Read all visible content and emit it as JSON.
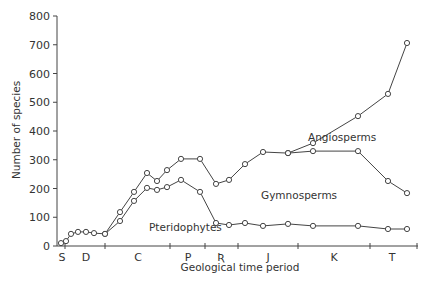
{
  "chart_data": {
    "type": "line",
    "title": "",
    "xlabel": "Geological time period",
    "ylabel": "Number of species",
    "ylim": [
      0,
      800
    ],
    "yticks": [
      0,
      100,
      200,
      300,
      400,
      500,
      600,
      700,
      800
    ],
    "grid": false,
    "legend": "inline labels",
    "period_labels": [
      "S",
      "D",
      "C",
      "P",
      "Tr",
      "J",
      "K",
      "T"
    ],
    "x_positions": [
      61,
      66,
      71,
      78,
      86,
      94,
      105,
      120,
      134,
      147,
      157,
      167,
      181,
      200,
      216,
      229,
      245,
      263,
      288,
      313,
      358,
      388,
      407
    ],
    "series": [
      {
        "name": "Pteridophytes",
        "x": [
          61,
          66,
          71,
          78,
          86,
          94,
          105,
          120,
          134,
          147,
          157,
          167,
          181,
          200,
          216,
          229,
          245,
          263,
          288,
          313,
          358,
          388,
          407
        ],
        "values": [
          10,
          17,
          42,
          49,
          49,
          45,
          42,
          87,
          157,
          202,
          195,
          205,
          230,
          188,
          80,
          73,
          80,
          70,
          77,
          70,
          70,
          59,
          59
        ]
      },
      {
        "name": "Gymnosperms (cumulative with Pteridophytes)",
        "x": [
          105,
          120,
          134,
          147,
          157,
          167,
          181,
          200,
          216,
          229,
          245,
          263,
          288,
          313,
          358,
          388,
          407
        ],
        "values": [
          42,
          118,
          188,
          254,
          226,
          264,
          303,
          303,
          216,
          230,
          285,
          327,
          323,
          330,
          330,
          226,
          184
        ]
      },
      {
        "name": "Angiosperms (cumulative total)",
        "x": [
          288,
          313,
          358,
          388,
          407
        ],
        "values": [
          323,
          358,
          452,
          529,
          706
        ]
      }
    ],
    "annotations": [
      {
        "text": "Angiosperms"
      },
      {
        "text": "Gymnosperms"
      },
      {
        "text": "Pteridophytes"
      }
    ]
  },
  "labels": {
    "xlabel": "Geological time period",
    "ylabel": "Number of species",
    "angiosperms": "Angiosperms",
    "gymnosperms": "Gymnosperms",
    "pteridophytes": "Pteridophytes",
    "periods": [
      "S",
      "D",
      "C",
      "P",
      "Ʀ",
      "J",
      "K",
      "T"
    ],
    "yticks": [
      "0",
      "100",
      "200",
      "300",
      "400",
      "500",
      "600",
      "700",
      "800"
    ]
  }
}
